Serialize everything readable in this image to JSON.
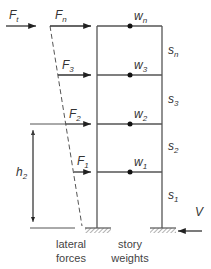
{
  "diagram": {
    "type": "building frame with lateral forces",
    "forces": {
      "top": {
        "label": "F",
        "sub": "t"
      },
      "floors": [
        {
          "label": "F",
          "sub": "n"
        },
        {
          "label": "F",
          "sub": "3"
        },
        {
          "label": "F",
          "sub": "2"
        },
        {
          "label": "F",
          "sub": "1"
        }
      ]
    },
    "weights": [
      {
        "label": "w",
        "sub": "n"
      },
      {
        "label": "w",
        "sub": "3"
      },
      {
        "label": "w",
        "sub": "2"
      },
      {
        "label": "w",
        "sub": "1"
      }
    ],
    "story_heights": [
      {
        "label": "s",
        "sub": "n"
      },
      {
        "label": "s",
        "sub": "3"
      },
      {
        "label": "s",
        "sub": "2"
      },
      {
        "label": "s",
        "sub": "1"
      }
    ],
    "height_dimension": {
      "label": "h",
      "sub": "2"
    },
    "base_shear": {
      "label": "V"
    },
    "captions": {
      "lateral": {
        "line1": "lateral",
        "line2": "forces"
      },
      "story": {
        "line1": "story",
        "line2": "weights"
      }
    },
    "colors": {
      "line": "#555555",
      "dot": "#111111",
      "text": "#333333"
    }
  }
}
